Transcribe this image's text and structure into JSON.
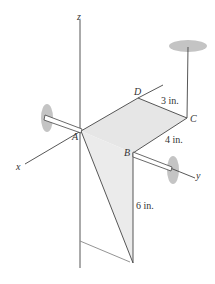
{
  "figure": {
    "axes": {
      "x": "x",
      "y": "y",
      "z": "z"
    },
    "points": {
      "A": "A",
      "B": "B",
      "C": "C",
      "D": "D"
    },
    "dimensions": {
      "dc": "3 in.",
      "cb": "4 in.",
      "vertical": "6 in."
    }
  },
  "colors": {
    "line": "#444444",
    "face": "#e4e4e4",
    "bearing": "#bdbdbd"
  }
}
